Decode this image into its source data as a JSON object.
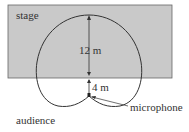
{
  "labels": {
    "stage": "stage",
    "audience": "audience",
    "distance_front": "12 m",
    "distance_back": "4 m",
    "microphone": "microphone"
  },
  "colors": {
    "stage_fill": "#c9c9c9",
    "stage_border": "#555555",
    "curve": "#333333"
  }
}
